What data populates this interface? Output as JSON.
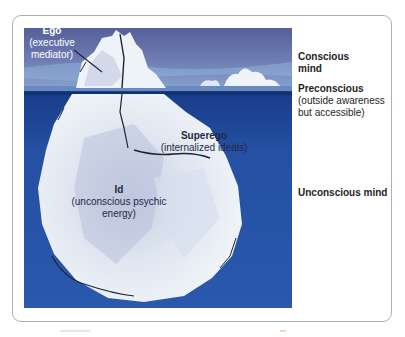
{
  "figure": {
    "colors": {
      "sky": "#5e6a9e",
      "sky_light": "#8fa3c9",
      "water_line": "#1b3f8c",
      "deep_water": "#2451a3",
      "ice": "#e6edf3",
      "ice_shadow": "#b8c2da",
      "frame_border": "#a9aebe",
      "label_light": "#ffffff",
      "label_dark": "#1d2a44"
    },
    "iceberg_labels": {
      "ego": {
        "title": "Ego",
        "subtitle_line1": "(executive",
        "subtitle_line2": "mediator)"
      },
      "superego": {
        "title": "Superego",
        "subtitle": "(internalized ideals)"
      },
      "id": {
        "title": "Id",
        "subtitle_line1": "(unconscious psychic",
        "subtitle_line2": "energy)"
      }
    },
    "side_labels": {
      "conscious": {
        "line1": "Conscious",
        "line2": "mind"
      },
      "preconscious": {
        "title": "Preconscious",
        "line1": "(outside awareness",
        "line2": "but accessible)"
      },
      "unconscious": {
        "title": "Unconscious mind"
      }
    }
  }
}
